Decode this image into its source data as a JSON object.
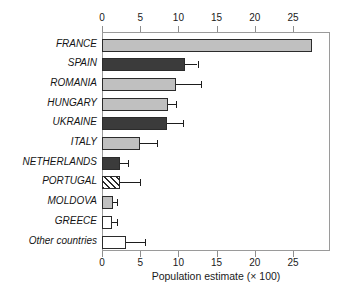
{
  "chart_data": {
    "type": "bar",
    "orientation": "horizontal",
    "title": "",
    "xlabel": "Population estimate (× 100)",
    "ylabel": "",
    "xlim": [
      0,
      29.8
    ],
    "xticks": [
      0,
      5,
      10,
      15,
      20,
      25
    ],
    "xtick_labels": [
      "0",
      "5",
      "10",
      "15",
      "20",
      "25"
    ],
    "grid": false,
    "legend": "none",
    "axis_top": true,
    "axis_bottom": true,
    "categories": [
      "FRANCE",
      "SPAIN",
      "ROMANIA",
      "HUNGARY",
      "UKRAINE",
      "ITALY",
      "NETHERLANDS",
      "PORTUGAL",
      "MOLDOVA",
      "GREECE",
      "Other countries"
    ],
    "values": [
      27.5,
      10.8,
      9.7,
      8.7,
      8.5,
      5.0,
      2.4,
      2.3,
      1.4,
      1.3,
      3.2
    ],
    "error_high": [
      null,
      12.5,
      12.9,
      9.7,
      10.6,
      7.2,
      3.4,
      5.0,
      2.0,
      1.9,
      5.6
    ],
    "fills": [
      "light",
      "dark",
      "light",
      "light",
      "dark",
      "light",
      "dark",
      "hatch",
      "light",
      "white",
      "white"
    ],
    "colors": {
      "light": "#c0c0c0",
      "dark": "#3b3b3b",
      "white": "#ffffff",
      "hatch": "#ffffff",
      "edge": "#2b2b2b",
      "error": "#1d1d1d",
      "frame": "#9a9a9a",
      "text": "#141414"
    }
  }
}
